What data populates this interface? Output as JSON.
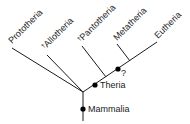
{
  "diagram": {
    "type": "cladogram",
    "colors": {
      "line": "#1a1a1a",
      "node": "#000000",
      "background": "#ffffff"
    },
    "taxa": [
      {
        "id": "prototheria",
        "label": "Prototheria",
        "extinct": false
      },
      {
        "id": "allotheria",
        "label": "Allotheria",
        "extinct": true,
        "dagger": "†"
      },
      {
        "id": "pantotheria",
        "label": "Pantotheria",
        "extinct": true,
        "dagger": "†"
      },
      {
        "id": "metatheria",
        "label": "Metatheria",
        "extinct": false
      },
      {
        "id": "eutheria",
        "label": "Eutheria",
        "extinct": false
      }
    ],
    "nodes": [
      {
        "id": "mammalia",
        "label": "Mammalia"
      },
      {
        "id": "theria",
        "label": "Theria"
      },
      {
        "id": "unnamed",
        "label": "?"
      }
    ]
  }
}
